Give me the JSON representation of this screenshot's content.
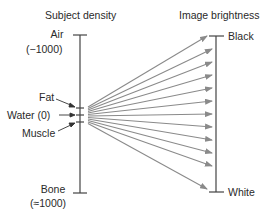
{
  "diagram": {
    "left_axis": {
      "title": "Subject density",
      "top_label": "Air",
      "top_value": "(−1000)",
      "markers": [
        {
          "label": "Fat"
        },
        {
          "label": "Water (0)"
        },
        {
          "label": "Muscle"
        }
      ],
      "bottom_label": "Bone",
      "bottom_value": "(≈1000)"
    },
    "right_axis": {
      "title": "Image brightness",
      "top_label": "Black",
      "bottom_label": "White"
    },
    "arrow_count": 12,
    "colors": {
      "axis": "#444444",
      "arrow": "#8a8a8a",
      "text": "#2a2a2a"
    }
  }
}
